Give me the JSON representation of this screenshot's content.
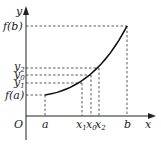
{
  "diagram": {
    "axes": {
      "x_label": "x",
      "y_label": "y",
      "origin_label": "O"
    },
    "y_labels": {
      "fb": "f(b)",
      "y2": "y",
      "y2_sub": "2",
      "y0": "y",
      "y0_sub": "0",
      "y1": "y",
      "y1_sub": "1",
      "fa": "f(a)"
    },
    "x_labels": {
      "a": "a",
      "x1": "x",
      "x1_sub": "1",
      "x0": "x",
      "x0_sub": "0",
      "x2": "x",
      "x2_sub": "2",
      "b": "b"
    },
    "curve": "increasing convex function from (a, f(a)) to (b, f(b))"
  }
}
